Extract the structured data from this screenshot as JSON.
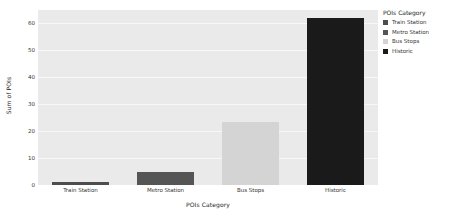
{
  "chart_data": {
    "type": "bar",
    "title": "",
    "xlabel": "POIs Category",
    "ylabel": "Sum of POIs",
    "categories": [
      "Train Station",
      "Metro Station",
      "Bus Stops",
      "Historic"
    ],
    "values": [
      1,
      5,
      23.5,
      62
    ],
    "series": [
      {
        "name": "POIs Category",
        "values": [
          1,
          5,
          23.5,
          62
        ]
      }
    ],
    "ylim": [
      0,
      65
    ],
    "yticks": [
      0,
      10,
      20,
      30,
      40,
      50,
      60
    ],
    "ytick_labels": [
      "0",
      "10",
      "20",
      "30",
      "40",
      "50",
      "60"
    ],
    "grid": true,
    "grid_axis": "y",
    "legend": {
      "title": "POIs Category",
      "position": "right",
      "entries": [
        {
          "label": "Train Station",
          "color": "#4d4d4d"
        },
        {
          "label": "Metro Station",
          "color": "#555555"
        },
        {
          "label": "Bus Stops",
          "color": "#d4d4d4"
        },
        {
          "label": "Historic",
          "color": "#1a1a1a"
        }
      ]
    },
    "bar_colors": [
      "#4d4d4d",
      "#555555",
      "#d4d4d4",
      "#1a1a1a"
    ],
    "plot_background": "#eaeaea",
    "figure_background": "#ffffff",
    "gridline_color": "#f7f7f7"
  }
}
